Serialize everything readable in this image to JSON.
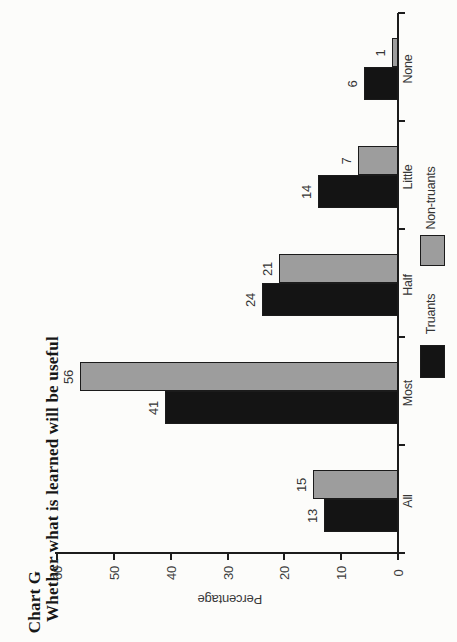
{
  "header": {
    "chart_label": "Chart G",
    "title": "Whether what is learned will be useful"
  },
  "chart_data": {
    "type": "bar",
    "title": "Whether what is learned will be useful",
    "categories": [
      "All",
      "Most",
      "Half",
      "Little",
      "None"
    ],
    "series": [
      {
        "name": "Truants",
        "color": "#141414",
        "values": [
          13,
          41,
          24,
          14,
          6
        ]
      },
      {
        "name": "Non-truants",
        "color": "#9d9d9d",
        "values": [
          15,
          56,
          21,
          7,
          1
        ]
      }
    ],
    "xlabel": "",
    "ylabel": "Percentage",
    "ylim": [
      0,
      60
    ],
    "yticks": [
      0,
      10,
      20,
      30,
      40,
      50,
      60
    ],
    "grid": false,
    "legend_position": "right-of-plot",
    "rotation": "page scanned with chart rotated 90deg counter-clockwise"
  },
  "colors": {
    "axis": "#1c1c1c",
    "label_text": "#3a3a3a",
    "title_text": "#171717",
    "page_background": "#fcfcfa"
  }
}
